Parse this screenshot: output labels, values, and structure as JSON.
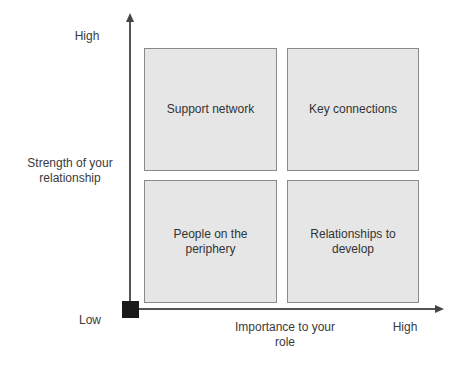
{
  "diagram": {
    "type": "2x2 matrix",
    "y_axis": {
      "title": "Strength of your relationship",
      "high_label": "High",
      "low_label": "Low"
    },
    "x_axis": {
      "title": "Importance to your role",
      "high_label": "High"
    },
    "quadrants": [
      {
        "position": "top-left",
        "label": "Support network"
      },
      {
        "position": "top-right",
        "label": "Key connections"
      },
      {
        "position": "bottom-left",
        "label": "People on the periphery"
      },
      {
        "position": "bottom-right",
        "label": "Relationships to develop"
      }
    ],
    "colors": {
      "quadrant_fill": "#e6e6e6",
      "quadrant_border": "#8a8a8a",
      "axis": "#555555",
      "origin_marker": "#1a1a1a"
    }
  }
}
